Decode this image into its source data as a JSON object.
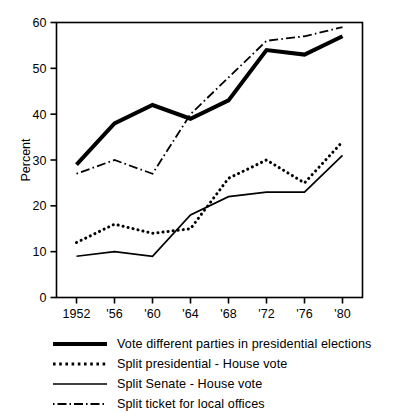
{
  "chart_data": {
    "type": "line",
    "title": "",
    "xlabel": "",
    "ylabel": "Percent",
    "x": [
      1952,
      1956,
      1960,
      1964,
      1968,
      1972,
      1976,
      1980
    ],
    "categories": [
      "1952",
      "'56",
      "'60",
      "'64",
      "'68",
      "'72",
      "'76",
      "'80"
    ],
    "xtick_labels": [
      "1952",
      "'56",
      "'60",
      "'64",
      "'68",
      "'72",
      "'76",
      "'80"
    ],
    "ytick_labels": [
      "0",
      "10",
      "20",
      "30",
      "40",
      "50",
      "60"
    ],
    "yticks": [
      0,
      10,
      20,
      30,
      40,
      50,
      60
    ],
    "ylim": [
      0,
      60
    ],
    "grid": false,
    "legend_position": "below",
    "series": [
      {
        "name": "Vote different parties in presidential elections",
        "style": "thick-solid",
        "color": "#000000",
        "values": [
          29,
          38,
          42,
          39,
          43,
          54,
          53,
          57
        ]
      },
      {
        "name": "Split presidential - House vote",
        "style": "dotted",
        "color": "#000000",
        "values": [
          12,
          16,
          14,
          15,
          26,
          30,
          25,
          34
        ]
      },
      {
        "name": "Split Senate - House vote",
        "style": "thin-solid",
        "color": "#000000",
        "values": [
          9,
          10,
          9,
          18,
          22,
          23,
          23,
          31
        ]
      },
      {
        "name": "Split ticket for local offices",
        "style": "dash-dot",
        "color": "#000000",
        "values": [
          27,
          30,
          27,
          40,
          48,
          56,
          57,
          59
        ]
      }
    ]
  },
  "axes": {
    "ylabel": "Percent",
    "ytick_labels": [
      "60",
      "50",
      "40",
      "30",
      "20",
      "10",
      "0"
    ],
    "xtick_labels": [
      "1952",
      "'56",
      "'60",
      "'64",
      "'68",
      "'72",
      "'76",
      "'80"
    ]
  },
  "legend": {
    "items": [
      {
        "sample": "thick-solid-line-sample",
        "label": "Vote different parties in presidential elections"
      },
      {
        "sample": "dotted-line-sample",
        "label": "Split presidential - House vote"
      },
      {
        "sample": "thin-solid-line-sample",
        "label": "Split  Senate - House  vote"
      },
      {
        "sample": "dash-dot-line-sample",
        "label": "Split ticket for local offices"
      }
    ]
  }
}
